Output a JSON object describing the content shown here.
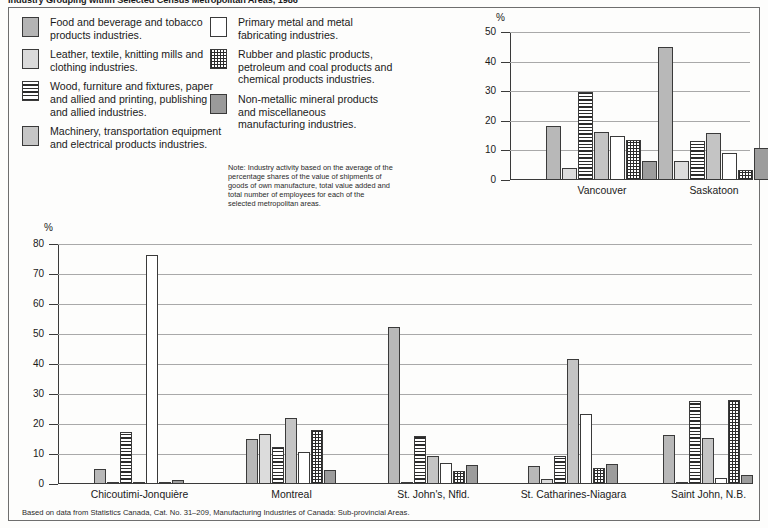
{
  "figure": {
    "title": "Industry Grouping within Selected Census Metropolitan Areas, 1986",
    "source": "Based on data from Statistics Canada, Cat. No. 31–209, Manufacturing Industries of Canada: Sub-provincial Areas.",
    "note": "Note: Industry activity based on the average of the percentage shares of the value of shipments of goods of own manufacture, total value added and total number of employees for each of the selected metropolitan areas."
  },
  "legend": {
    "left": [
      {
        "key": "food",
        "swatch": "sw-food",
        "label": "Food and beverage and tobacco products industries."
      },
      {
        "key": "leather",
        "swatch": "sw-leather",
        "label": "Leather, textile, knitting mills and clothing industries."
      },
      {
        "key": "wood",
        "swatch": "sw-wood",
        "label": "Wood, furniture and fixtures, paper and allied and printing, publishing and allied industries."
      },
      {
        "key": "machinery",
        "swatch": "sw-machinery",
        "label": "Machinery, transportation equipment and electrical products industries."
      }
    ],
    "right": [
      {
        "key": "primary",
        "swatch": "sw-primary",
        "label": "Primary metal and metal fabricating industries."
      },
      {
        "key": "rubber",
        "swatch": "sw-rubber",
        "label": "Rubber and plastic products, petroleum and coal products and chemical products industries."
      },
      {
        "key": "nonmet",
        "swatch": "sw-nonmet",
        "label": "Non-metallic mineral products and miscellaneous manufacturing industries."
      }
    ]
  },
  "chart_data": [
    {
      "id": "top",
      "type": "bar",
      "title": "",
      "xlabel": "",
      "ylabel": "%",
      "ylim": [
        0,
        50
      ],
      "yticks": [
        0,
        10,
        20,
        30,
        40,
        50
      ],
      "grid": true,
      "legend_position": "external",
      "categories": [
        "Vancouver",
        "Saskatoon"
      ],
      "series": [
        {
          "name": "Food and beverage and tobacco products industries.",
          "key": "food",
          "values": [
            18.2,
            44.8
          ]
        },
        {
          "name": "Leather, textile, knitting mills and clothing industries.",
          "key": "leather",
          "values": [
            4.0,
            6.4
          ]
        },
        {
          "name": "Wood, furniture and fixtures, paper and allied and printing, publishing and allied industries.",
          "key": "wood",
          "values": [
            29.9,
            13.1
          ]
        },
        {
          "name": "Machinery, transportation equipment and electrical products industries.",
          "key": "machinery",
          "values": [
            16.1,
            15.9
          ]
        },
        {
          "name": "Primary metal and metal fabricating industries.",
          "key": "primary",
          "values": [
            15.0,
            9.0
          ]
        },
        {
          "name": "Rubber and plastic products, petroleum and coal products and chemical products industries.",
          "key": "rubber",
          "values": [
            13.4,
            3.5
          ]
        },
        {
          "name": "Non-metallic mineral products and miscellaneous manufacturing industries.",
          "key": "nonmet",
          "values": [
            6.4,
            10.7
          ]
        }
      ]
    },
    {
      "id": "bottom",
      "type": "bar",
      "title": "",
      "xlabel": "",
      "ylabel": "%",
      "ylim": [
        0,
        80
      ],
      "yticks": [
        0,
        10,
        20,
        30,
        40,
        50,
        60,
        70,
        80
      ],
      "grid": true,
      "legend_position": "external",
      "categories": [
        "Chicoutimi-Jonquière",
        "Montreal",
        "St. John's, Nfld.",
        "St. Catharines-Niagara",
        "Saint John, N.B."
      ],
      "series": [
        {
          "name": "Food and beverage and tobacco products industries.",
          "key": "food",
          "values": [
            5.0,
            15.0,
            52.3,
            6.0,
            16.5
          ]
        },
        {
          "name": "Leather, textile, knitting mills and clothing industries.",
          "key": "leather",
          "values": [
            0.6,
            16.7,
            0.5,
            1.6,
            0.6
          ]
        },
        {
          "name": "Wood, furniture and fixtures, paper and allied and printing, publishing and allied industries.",
          "key": "wood",
          "values": [
            17.2,
            12.2,
            16.0,
            9.4,
            27.7
          ]
        },
        {
          "name": "Machinery, transportation equipment and electrical products industries.",
          "key": "machinery",
          "values": [
            0.6,
            22.0,
            9.5,
            41.6,
            15.5
          ]
        },
        {
          "name": "Primary metal and metal fabricating industries.",
          "key": "primary",
          "values": [
            76.4,
            10.6,
            7.0,
            23.4,
            2.0
          ]
        },
        {
          "name": "Rubber and plastic products, petroleum and coal products and chemical products industries.",
          "key": "rubber",
          "values": [
            0.4,
            18.0,
            4.4,
            5.5,
            28.0
          ]
        },
        {
          "name": "Non-metallic mineral products and miscellaneous manufacturing industries.",
          "key": "nonmet",
          "values": [
            1.5,
            4.6,
            6.5,
            6.6,
            3.0
          ]
        }
      ]
    }
  ]
}
